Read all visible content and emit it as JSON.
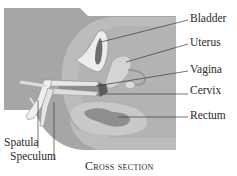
{
  "diagram": {
    "title": "Cross section",
    "caption": "Cross section",
    "labels": [
      {
        "id": "bladder",
        "text": "Bladder"
      },
      {
        "id": "uterus",
        "text": "Uterus"
      },
      {
        "id": "vagina",
        "text": "Vagina"
      },
      {
        "id": "cervix",
        "text": "Cervix"
      },
      {
        "id": "rectum",
        "text": "Rectum"
      },
      {
        "id": "spatula",
        "text": "Spatula"
      },
      {
        "id": "speculum",
        "text": "Speculum"
      }
    ],
    "colors": {
      "background_body": "#a9a9a9",
      "tissue_mid": "#bdbdbd",
      "tissue_light": "#cfcfcf",
      "organ_dark": "#7d7d7d",
      "instrument": "#e6e6e6",
      "leader_line": "#3a3a3a",
      "text": "#2a2a2a"
    }
  }
}
